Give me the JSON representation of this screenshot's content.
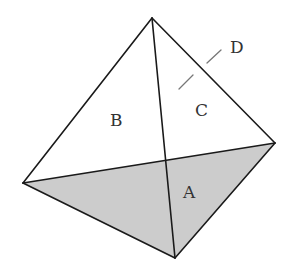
{
  "diagram": {
    "type": "tetrahedron",
    "vertices": {
      "top": [
        152,
        18
      ],
      "left": [
        23,
        183
      ],
      "right": [
        275,
        143
      ],
      "bottom": [
        175,
        258
      ]
    },
    "shaded_face": {
      "label": "A",
      "fill": "#cccccc"
    },
    "labels": {
      "A": "A",
      "B": "B",
      "C": "C",
      "D": "D"
    },
    "colors": {
      "edge": "#1a1a1a",
      "shade": "#cccccc",
      "pointer": "#777777",
      "text": "#333333"
    }
  }
}
